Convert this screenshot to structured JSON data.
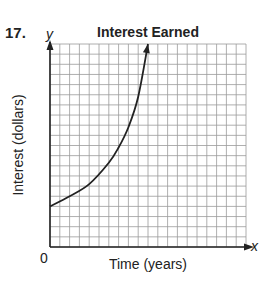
{
  "question_number": "17.",
  "chart_data": {
    "type": "line",
    "title": "Interest Earned",
    "xlabel": "Time (years)",
    "ylabel": "Interest (dollars)",
    "x_axis_variable": "x",
    "y_axis_variable": "y",
    "origin_label": "0",
    "grid": true,
    "grid_cells": {
      "columns": 20,
      "rows": 20
    },
    "xlim": [
      0,
      20
    ],
    "ylim": [
      0,
      20
    ],
    "tick_labels": {
      "x": [],
      "y": []
    },
    "series": [
      {
        "name": "Interest Earned",
        "shape": "exponential growth",
        "x": [
          0,
          2,
          4,
          6,
          7,
          8,
          9,
          10
        ],
        "y": [
          4,
          5,
          6.2,
          8.3,
          9.8,
          11.8,
          14.8,
          20
        ],
        "end_arrow": true
      }
    ],
    "legend": null
  },
  "colors": {
    "grid": "#9a9a9a",
    "axis": "#222222",
    "curve": "#222222"
  }
}
